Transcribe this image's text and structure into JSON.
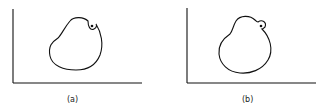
{
  "panels": [
    {
      "label": "(a)",
      "description": "closed curve with small inward notch containing a dot near upper right"
    },
    {
      "label": "(b)",
      "description": "closed curve with small outward bulge containing a dot near upper right"
    }
  ],
  "colors": {
    "stroke": "#111111",
    "background": "#ffffff"
  }
}
